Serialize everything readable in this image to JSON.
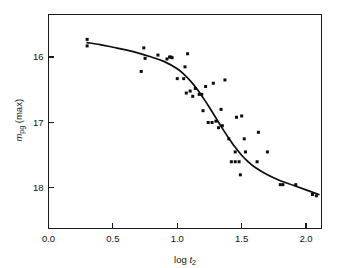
{
  "chart_data": {
    "type": "scatter",
    "title": "",
    "subtitle": "",
    "xlabel": "log t2",
    "xlabel_parts": {
      "prefix": "log ",
      "italic": "t",
      "subscript": "2"
    },
    "ylabel": "mpg (max)",
    "ylabel_parts": {
      "italic": "m",
      "subscript": "pg",
      "suffix": " (max)"
    },
    "xlim": [
      0.0,
      2.12
    ],
    "ylim": [
      15.35,
      18.62
    ],
    "y_inverted": true,
    "grid": false,
    "legend": null,
    "legend_position": "none",
    "xticks": [
      0.0,
      0.5,
      1.0,
      1.5,
      2.0
    ],
    "xticklabels": [
      "0.0",
      "0.5",
      "1.0",
      "1.5",
      "2.0"
    ],
    "yticks": [
      16,
      17,
      18
    ],
    "yticklabels": [
      "16",
      "17",
      "18"
    ],
    "tick_direction": "in",
    "frame": "box",
    "marker": "square",
    "marker_size": 3.0,
    "marker_color": "#0d0d0d",
    "curve_color": "#0d0d0d",
    "points": [
      {
        "x": 0.3,
        "y": 15.73
      },
      {
        "x": 0.3,
        "y": 15.83
      },
      {
        "x": 0.72,
        "y": 16.22
      },
      {
        "x": 0.74,
        "y": 15.86
      },
      {
        "x": 0.75,
        "y": 16.02
      },
      {
        "x": 0.85,
        "y": 15.97
      },
      {
        "x": 0.92,
        "y": 16.03
      },
      {
        "x": 0.94,
        "y": 16.0
      },
      {
        "x": 0.95,
        "y": 16.0
      },
      {
        "x": 0.96,
        "y": 16.01
      },
      {
        "x": 1.0,
        "y": 16.33
      },
      {
        "x": 1.05,
        "y": 16.33
      },
      {
        "x": 1.06,
        "y": 16.15
      },
      {
        "x": 1.07,
        "y": 16.55
      },
      {
        "x": 1.08,
        "y": 15.95
      },
      {
        "x": 1.1,
        "y": 16.52
      },
      {
        "x": 1.12,
        "y": 16.6
      },
      {
        "x": 1.14,
        "y": 16.48
      },
      {
        "x": 1.17,
        "y": 16.57
      },
      {
        "x": 1.19,
        "y": 16.57
      },
      {
        "x": 1.2,
        "y": 16.82
      },
      {
        "x": 1.22,
        "y": 16.45
      },
      {
        "x": 1.24,
        "y": 17.0
      },
      {
        "x": 1.27,
        "y": 17.0
      },
      {
        "x": 1.28,
        "y": 16.4
      },
      {
        "x": 1.3,
        "y": 16.98
      },
      {
        "x": 1.32,
        "y": 17.08
      },
      {
        "x": 1.34,
        "y": 16.8
      },
      {
        "x": 1.35,
        "y": 17.05
      },
      {
        "x": 1.37,
        "y": 16.35
      },
      {
        "x": 1.4,
        "y": 17.25
      },
      {
        "x": 1.42,
        "y": 17.6
      },
      {
        "x": 1.45,
        "y": 17.6
      },
      {
        "x": 1.45,
        "y": 17.45
      },
      {
        "x": 1.46,
        "y": 16.92
      },
      {
        "x": 1.48,
        "y": 17.6
      },
      {
        "x": 1.49,
        "y": 17.8
      },
      {
        "x": 1.5,
        "y": 16.9
      },
      {
        "x": 1.52,
        "y": 17.25
      },
      {
        "x": 1.53,
        "y": 17.45
      },
      {
        "x": 1.62,
        "y": 17.6
      },
      {
        "x": 1.63,
        "y": 17.15
      },
      {
        "x": 1.7,
        "y": 17.45
      },
      {
        "x": 1.8,
        "y": 17.95
      },
      {
        "x": 1.82,
        "y": 17.95
      },
      {
        "x": 1.92,
        "y": 17.95
      },
      {
        "x": 2.05,
        "y": 18.1
      },
      {
        "x": 2.08,
        "y": 18.12
      }
    ],
    "fit_curve": {
      "description": "sigmoid decline-rate fit",
      "points": [
        {
          "x": 0.3,
          "y": 15.78
        },
        {
          "x": 0.4,
          "y": 15.81
        },
        {
          "x": 0.5,
          "y": 15.85
        },
        {
          "x": 0.6,
          "y": 15.89
        },
        {
          "x": 0.7,
          "y": 15.94
        },
        {
          "x": 0.8,
          "y": 16.0
        },
        {
          "x": 0.9,
          "y": 16.07
        },
        {
          "x": 1.0,
          "y": 16.18
        },
        {
          "x": 1.05,
          "y": 16.26
        },
        {
          "x": 1.1,
          "y": 16.36
        },
        {
          "x": 1.15,
          "y": 16.48
        },
        {
          "x": 1.2,
          "y": 16.62
        },
        {
          "x": 1.25,
          "y": 16.77
        },
        {
          "x": 1.3,
          "y": 16.93
        },
        {
          "x": 1.35,
          "y": 17.09
        },
        {
          "x": 1.4,
          "y": 17.24
        },
        {
          "x": 1.45,
          "y": 17.38
        },
        {
          "x": 1.5,
          "y": 17.5
        },
        {
          "x": 1.55,
          "y": 17.6
        },
        {
          "x": 1.6,
          "y": 17.68
        },
        {
          "x": 1.7,
          "y": 17.8
        },
        {
          "x": 1.8,
          "y": 17.89
        },
        {
          "x": 1.9,
          "y": 17.96
        },
        {
          "x": 2.0,
          "y": 18.03
        },
        {
          "x": 2.1,
          "y": 18.1
        }
      ]
    }
  }
}
